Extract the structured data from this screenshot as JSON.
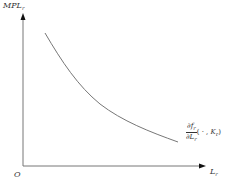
{
  "diagram": {
    "type": "economics-marginal-product-curve",
    "colors": {
      "axis": "#777777",
      "curve": "#777777",
      "text": "#333333",
      "background": "#ffffff"
    },
    "y_axis": {
      "label_base": "MPL",
      "label_sub": "r"
    },
    "x_axis": {
      "label_base": "L",
      "label_sub": "r"
    },
    "origin_label": "O",
    "curve": {
      "shape": "downward-sloping convex",
      "label": {
        "numerator_base": "∂f",
        "numerator_sub": "r",
        "denominator_base": "∂L",
        "denominator_sub": "r",
        "args_open": "( · , ",
        "args_var_base": "K",
        "args_var_sub": "r",
        "args_close": ")"
      }
    }
  }
}
